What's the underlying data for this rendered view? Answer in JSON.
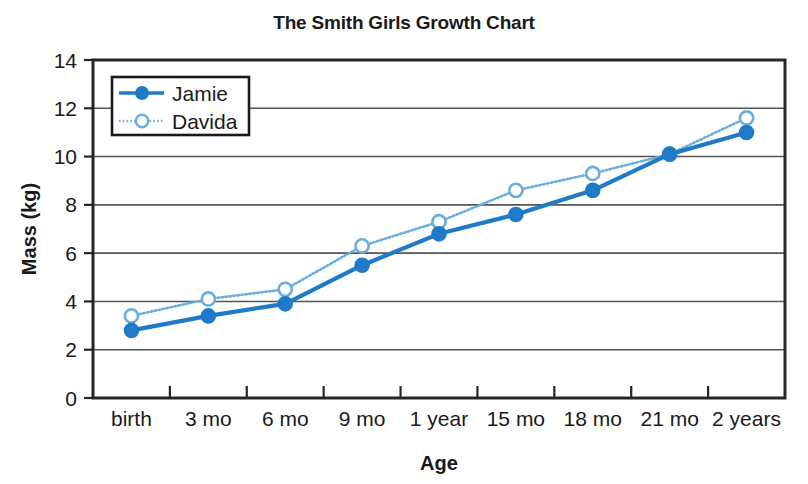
{
  "chart_data": {
    "type": "line",
    "title": "The Smith Girls Growth Chart",
    "xlabel": "Age",
    "ylabel": "Mass (kg)",
    "categories": [
      "birth",
      "3 mo",
      "6 mo",
      "9 mo",
      "1 year",
      "15 mo",
      "18 mo",
      "21 mo",
      "2 years"
    ],
    "series": [
      {
        "name": "Jamie",
        "values": [
          2.8,
          3.4,
          3.9,
          5.5,
          6.8,
          7.6,
          8.6,
          10.1,
          11.0
        ],
        "color": "#1f7bc8",
        "line_style": "solid",
        "marker": "filled-circle"
      },
      {
        "name": "Davida",
        "values": [
          3.4,
          4.1,
          4.5,
          6.3,
          7.3,
          8.6,
          9.3,
          10.1,
          11.6
        ],
        "color": "#6aaedb",
        "line_style": "dotted",
        "marker": "open-circle"
      }
    ],
    "ylim": [
      0,
      14
    ],
    "yticks": [
      0,
      2,
      4,
      6,
      8,
      10,
      12,
      14
    ],
    "ytick_labels": [
      "0",
      "2",
      "4",
      "6",
      "8",
      "10",
      "12",
      "14"
    ],
    "gridlines": [
      2,
      4,
      6,
      8,
      10,
      12
    ],
    "grid": true,
    "legend_position": "upper-left-inside"
  },
  "legend": {
    "entries": [
      {
        "label": "Jamie"
      },
      {
        "label": "Davida"
      }
    ]
  }
}
